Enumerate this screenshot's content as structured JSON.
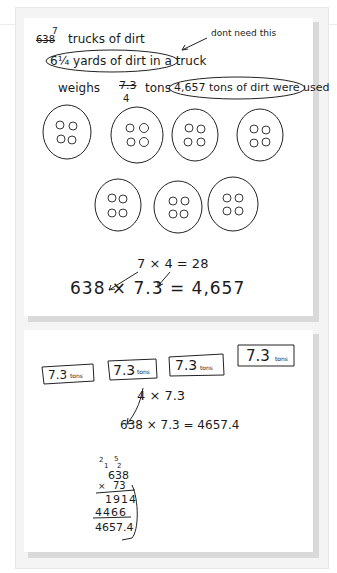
{
  "panel_top": {
    "line1": {
      "strikeout": "638",
      "correction": "7",
      "text": "trucks of dirt"
    },
    "line2": {
      "text": "6¼ yards of dirt in a truck",
      "fraction_whole": "6",
      "fraction_num": "1",
      "fraction_den": "4",
      "rest": "yards of dirt in a truck"
    },
    "annotation": "dont need this",
    "line3": {
      "prefix": "weighs",
      "strikeout": "7.3",
      "correction": "4",
      "unit": "tons",
      "circled": "4,657 tons of dirt were used"
    },
    "groups": {
      "count": 7,
      "items_per_group": 4
    },
    "equation1": "7 × 4 = 28",
    "equation2": "638 × 7.3 = 4,657"
  },
  "panel_bottom": {
    "boxes": [
      "7.3",
      "7.3",
      "7.3",
      "7.3"
    ],
    "box_unit": "tons",
    "equation1": "4 × 7.3",
    "equation2": "638 × 7.3 = 4657.4",
    "long_multiplication": {
      "carries_top": [
        "2",
        "5"
      ],
      "carries_mid": [
        "1",
        "2"
      ],
      "multiplicand": "638",
      "multiplier": "73",
      "partial1": "1914",
      "partial2": "4466",
      "result": "4657.4"
    }
  }
}
